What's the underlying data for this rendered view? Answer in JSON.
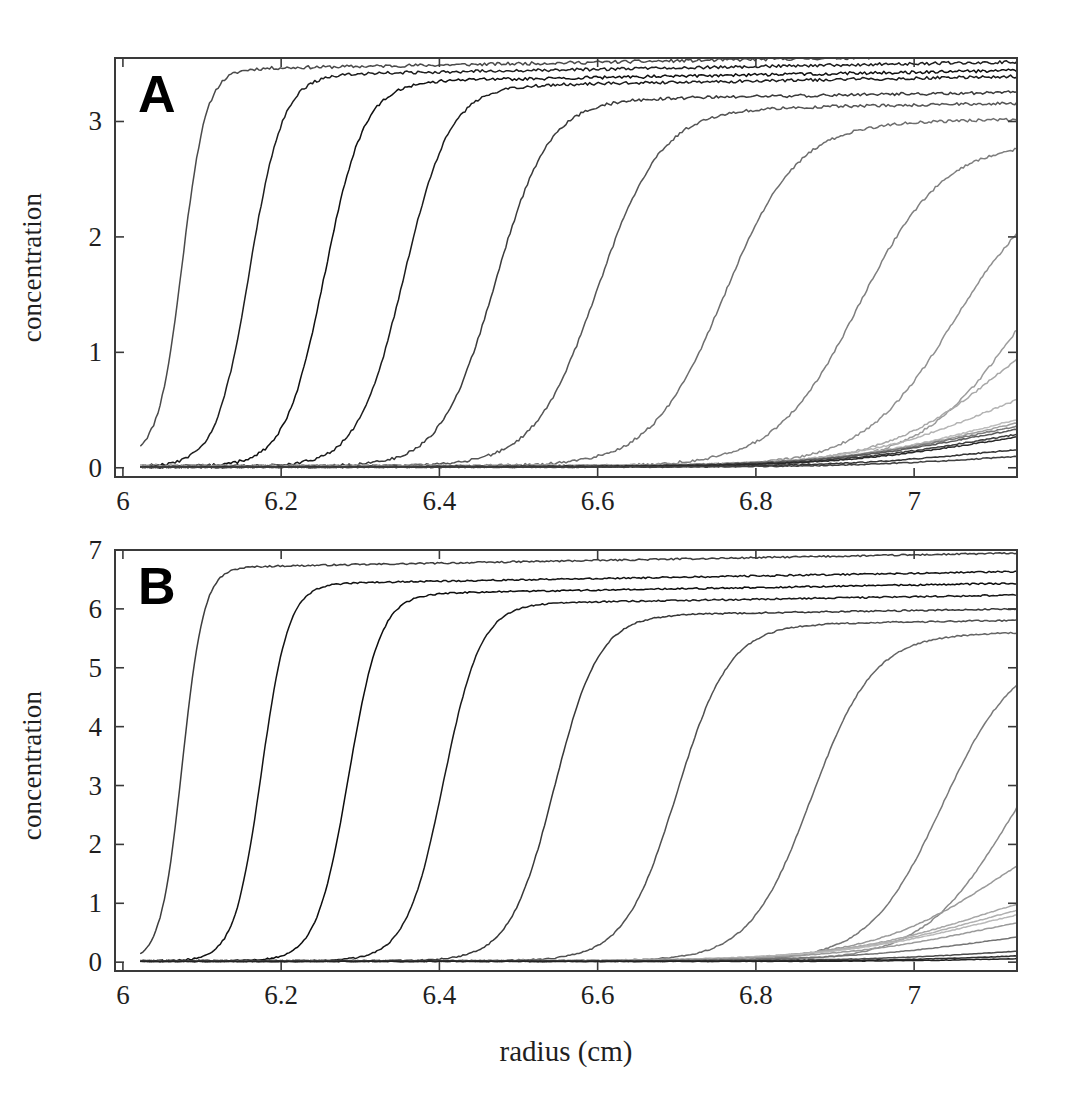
{
  "figure": {
    "background": "#ffffff",
    "line_color_dark": "#1a1a1a",
    "frame_color": "#3a3a3a"
  },
  "panels": [
    {
      "id": "A",
      "letter": "A",
      "ylabel": "concentration",
      "xlabel": "",
      "xticks": [
        "6",
        "6.2",
        "6.4",
        "6.6",
        "6.8",
        "7"
      ]
    },
    {
      "id": "B",
      "letter": "B",
      "ylabel": "concentration",
      "xlabel": "radius (cm)",
      "xticks": [
        "6",
        "6.2",
        "6.4",
        "6.6",
        "6.8",
        "7"
      ]
    }
  ],
  "chart_data": [
    {
      "type": "line",
      "panel": "A",
      "title": "",
      "xlabel": "",
      "ylabel": "concentration",
      "xlim": [
        5.99,
        7.13
      ],
      "ylim": [
        -0.08,
        3.55
      ],
      "xticks": [
        6,
        6.2,
        6.4,
        6.6,
        6.8,
        7
      ],
      "yticks": [
        0,
        1,
        2,
        3
      ],
      "xtick_labels": [
        "6",
        "6.2",
        "6.4",
        "6.6",
        "6.8",
        "7"
      ],
      "ytick_labels": [
        "0",
        "1",
        "2",
        "3"
      ],
      "grid": false,
      "legend": "none",
      "meniscus": 6.02,
      "description": "Sedimentation velocity concentration profiles versus radius at successive scan times; grayscale encodes scan order.",
      "series": [
        {
          "name": "scan-1",
          "gray": "#4a4a4a",
          "plateau": 3.45,
          "midpoint": 6.075,
          "width": 0.03,
          "baseline": 0.1
        },
        {
          "name": "scan-2",
          "gray": "#1e1e1e",
          "plateau": 3.4,
          "midpoint": 6.16,
          "width": 0.042,
          "baseline": 0.01
        },
        {
          "name": "scan-3",
          "gray": "#101010",
          "plateau": 3.34,
          "midpoint": 6.255,
          "width": 0.05,
          "baseline": 0.01
        },
        {
          "name": "scan-4",
          "gray": "#1c1c1c",
          "plateau": 3.3,
          "midpoint": 6.355,
          "width": 0.058,
          "baseline": 0.01
        },
        {
          "name": "scan-5",
          "gray": "#3b3b3b",
          "plateau": 3.18,
          "midpoint": 6.47,
          "width": 0.068,
          "baseline": 0.01
        },
        {
          "name": "scan-6",
          "gray": "#555555",
          "plateau": 3.1,
          "midpoint": 6.6,
          "width": 0.08,
          "baseline": 0.01
        },
        {
          "name": "scan-7",
          "gray": "#6d6d6d",
          "plateau": 2.98,
          "midpoint": 6.76,
          "width": 0.092,
          "baseline": 0.012
        },
        {
          "name": "scan-8",
          "gray": "#7e7e7e",
          "plateau": 2.8,
          "midpoint": 6.93,
          "width": 0.105,
          "baseline": 0.012
        },
        {
          "name": "scan-9",
          "gray": "#8f8f8f",
          "plateau": 2.52,
          "midpoint": 7.05,
          "width": 0.115,
          "baseline": 0.014
        },
        {
          "name": "scan-10",
          "gray": "#9c9c9c",
          "plateau": 2.38,
          "midpoint": 7.13,
          "width": 0.125,
          "baseline": 0.014
        },
        {
          "name": "scan-11",
          "gray": "#a8a8a8",
          "plateau": 1.65,
          "midpoint": 7.11,
          "width": 0.15,
          "baseline": 0.016
        },
        {
          "name": "scan-12",
          "gray": "#b4b4b4",
          "plateau": 0.97,
          "midpoint": 7.095,
          "width": 0.175,
          "baseline": 0.016
        },
        {
          "name": "scan-13",
          "gray": "#bcbcbc",
          "plateau": 0.68,
          "midpoint": 7.09,
          "width": 0.19,
          "baseline": 0.016
        },
        {
          "name": "scan-14",
          "gray": "#a0a0a0",
          "plateau": 0.62,
          "midpoint": 7.085,
          "width": 0.195,
          "baseline": 0.014
        },
        {
          "name": "scan-15",
          "gray": "#7a7a7a",
          "plateau": 0.57,
          "midpoint": 7.08,
          "width": 0.2,
          "baseline": 0.012
        },
        {
          "name": "scan-16",
          "gray": "#5a5a5a",
          "plateau": 0.53,
          "midpoint": 7.08,
          "width": 0.205,
          "baseline": 0.01
        },
        {
          "name": "scan-17",
          "gray": "#3c3c3c",
          "plateau": 0.47,
          "midpoint": 7.085,
          "width": 0.205,
          "baseline": 0.008
        },
        {
          "name": "scan-18",
          "gray": "#2a2a2a",
          "plateau": 0.44,
          "midpoint": 7.09,
          "width": 0.205,
          "baseline": 0.008
        },
        {
          "name": "scan-19",
          "gray": "#343434",
          "plateau": 0.27,
          "midpoint": 7.1,
          "width": 0.2,
          "baseline": 0.006
        },
        {
          "name": "scan-20",
          "gray": "#404040",
          "plateau": 0.17,
          "midpoint": 7.105,
          "width": 0.195,
          "baseline": 0.005
        }
      ]
    },
    {
      "type": "line",
      "panel": "B",
      "title": "",
      "xlabel": "radius (cm)",
      "ylabel": "concentration",
      "xlim": [
        5.99,
        7.13
      ],
      "ylim": [
        -0.15,
        7.0
      ],
      "xticks": [
        6,
        6.2,
        6.4,
        6.6,
        6.8,
        7
      ],
      "yticks": [
        0,
        1,
        2,
        3,
        4,
        5,
        6,
        7
      ],
      "xtick_labels": [
        "6",
        "6.2",
        "6.4",
        "6.6",
        "6.8",
        "7"
      ],
      "ytick_labels": [
        "0",
        "1",
        "2",
        "3",
        "4",
        "5",
        "6",
        "7"
      ],
      "grid": false,
      "legend": "none",
      "meniscus": 6.02,
      "description": "Sedimentation velocity concentration profiles versus radius at successive scan times, higher loading concentration; grayscale encodes scan order.",
      "series": [
        {
          "name": "scan-1",
          "gray": "#3d3d3d",
          "plateau": 6.7,
          "midpoint": 6.075,
          "width": 0.027,
          "baseline": 0.02
        },
        {
          "name": "scan-2",
          "gray": "#141414",
          "plateau": 6.42,
          "midpoint": 6.175,
          "width": 0.034,
          "baseline": 0.02
        },
        {
          "name": "scan-3",
          "gray": "#0d0d0d",
          "plateau": 6.25,
          "midpoint": 6.285,
          "width": 0.04,
          "baseline": 0.02
        },
        {
          "name": "scan-4",
          "gray": "#1a1a1a",
          "plateau": 6.08,
          "midpoint": 6.405,
          "width": 0.047,
          "baseline": 0.02
        },
        {
          "name": "scan-5",
          "gray": "#383838",
          "plateau": 5.88,
          "midpoint": 6.545,
          "width": 0.056,
          "baseline": 0.02
        },
        {
          "name": "scan-6",
          "gray": "#4f4f4f",
          "plateau": 5.72,
          "midpoint": 6.7,
          "width": 0.066,
          "baseline": 0.02
        },
        {
          "name": "scan-7",
          "gray": "#656565",
          "plateau": 5.55,
          "midpoint": 6.87,
          "width": 0.078,
          "baseline": 0.02
        },
        {
          "name": "scan-8",
          "gray": "#787878",
          "plateau": 5.28,
          "midpoint": 7.035,
          "width": 0.092,
          "baseline": 0.02
        },
        {
          "name": "scan-9",
          "gray": "#8a8a8a",
          "plateau": 4.8,
          "midpoint": 7.12,
          "width": 0.11,
          "baseline": 0.02
        },
        {
          "name": "scan-10",
          "gray": "#999999",
          "plateau": 2.9,
          "midpoint": 7.11,
          "width": 0.165,
          "baseline": 0.02
        },
        {
          "name": "scan-11",
          "gray": "#a6a6a6",
          "plateau": 1.62,
          "midpoint": 7.09,
          "width": 0.19,
          "baseline": 0.02
        },
        {
          "name": "scan-12",
          "gray": "#b0b0b0",
          "plateau": 1.42,
          "midpoint": 7.085,
          "width": 0.195,
          "baseline": 0.02
        },
        {
          "name": "scan-13",
          "gray": "#b8b8b8",
          "plateau": 1.3,
          "midpoint": 7.085,
          "width": 0.2,
          "baseline": 0.02
        },
        {
          "name": "scan-14",
          "gray": "#9a9a9a",
          "plateau": 1.1,
          "midpoint": 7.09,
          "width": 0.2,
          "baseline": 0.02
        },
        {
          "name": "scan-15",
          "gray": "#747474",
          "plateau": 0.72,
          "midpoint": 7.1,
          "width": 0.195,
          "baseline": 0.02
        },
        {
          "name": "scan-16",
          "gray": "#4c4c4c",
          "plateau": 0.32,
          "midpoint": 7.11,
          "width": 0.18,
          "baseline": 0.02
        },
        {
          "name": "scan-17",
          "gray": "#2e2e2e",
          "plateau": 0.18,
          "midpoint": 7.115,
          "width": 0.17,
          "baseline": 0.015
        },
        {
          "name": "scan-18",
          "gray": "#222222",
          "plateau": 0.1,
          "midpoint": 7.12,
          "width": 0.16,
          "baseline": 0.012
        }
      ]
    }
  ]
}
